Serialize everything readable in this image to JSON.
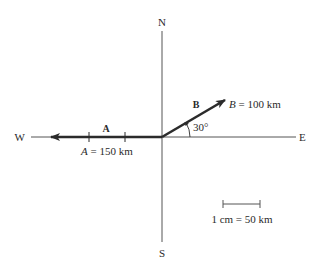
{
  "diagram": {
    "compass": {
      "north": "N",
      "south": "S",
      "east": "E",
      "west": "W"
    },
    "vectors": [
      {
        "id": "A",
        "name_label": "A",
        "magnitude_label": "A = 150 km",
        "magnitude_symbol": "A",
        "magnitude_text": " = 150 km",
        "magnitude_km": 150,
        "direction": "W",
        "angle_deg": 180,
        "tick_marks": 2
      },
      {
        "id": "B",
        "name_label": "B",
        "magnitude_label": "B = 100 km",
        "magnitude_symbol": "B",
        "magnitude_text": " = 100 km",
        "magnitude_km": 100,
        "direction": "30° N of E",
        "angle_deg": 30,
        "angle_label": "30°"
      }
    ],
    "scale": {
      "label": "1 cm = 50 km"
    },
    "colors": {
      "vector": "#2b2b2b",
      "axis": "#555555",
      "background": "#ffffff"
    }
  }
}
